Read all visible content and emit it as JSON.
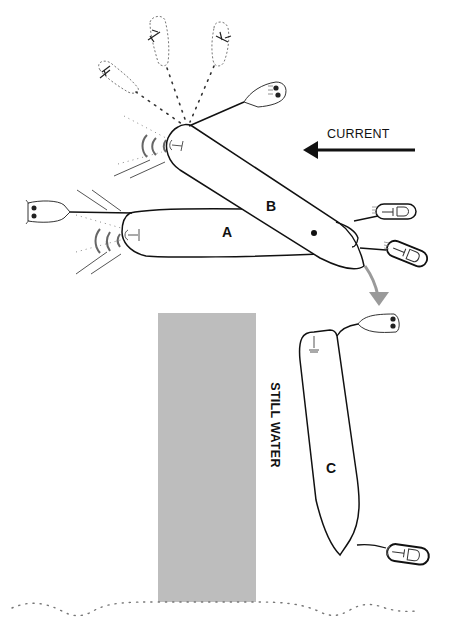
{
  "diagram": {
    "labels": {
      "current": "CURRENT",
      "still_water": "STILL WATER",
      "boat_a": "A",
      "boat_b": "B",
      "boat_c": "C"
    },
    "colors": {
      "line": "#111111",
      "still_water_fill": "#bdbdbd",
      "drift_arrow": "#9a9a9a",
      "dotted": "#666666"
    },
    "elements": {
      "current_arrow": {
        "direction": "left"
      },
      "drift_arrow": {
        "from": "B",
        "to": "C"
      },
      "still_water_area": {
        "x": 158,
        "y": 313,
        "width": 98,
        "height": 289
      },
      "riverbank": {
        "style": "dotted"
      },
      "tugs": [
        {
          "attached_to": "A",
          "position": "bow"
        },
        {
          "attached_to": "B",
          "position": "bow"
        },
        {
          "attached_to": "B",
          "position": "stern-upper"
        },
        {
          "attached_to": "B",
          "position": "stern-lower"
        },
        {
          "attached_to": "C",
          "position": "bow"
        },
        {
          "attached_to": "C",
          "position": "stern"
        }
      ],
      "ghost_tugs_count": 3
    }
  }
}
